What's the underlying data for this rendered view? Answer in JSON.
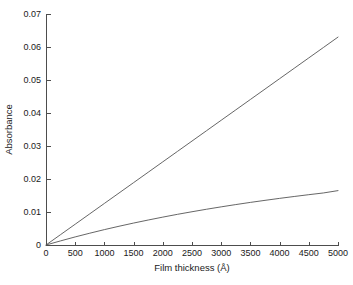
{
  "chart_data": {
    "type": "line",
    "title": "",
    "xlabel": "Film thickness (Å)",
    "ylabel": "Absorbance",
    "xlim": [
      0,
      5000
    ],
    "ylim": [
      0,
      0.07
    ],
    "xticks": [
      0,
      500,
      1000,
      1500,
      2000,
      2500,
      3000,
      3500,
      4000,
      4500,
      5000
    ],
    "xtick_labels": [
      "0",
      "500",
      "1000",
      "1500",
      "2000",
      "2500",
      "3000",
      "3500",
      "4000",
      "4500",
      "5000"
    ],
    "yticks": [
      0,
      0.01,
      0.02,
      0.03,
      0.04,
      0.05,
      0.06,
      0.07
    ],
    "ytick_labels": [
      "0",
      "0.01",
      "0.02",
      "0.03",
      "0.04",
      "0.05",
      "0.06",
      "0.07"
    ],
    "grid": false,
    "legend": null,
    "line_color": "#555555",
    "axis_color": "#4d4d4d",
    "background": "#ffffff",
    "x": [
      0,
      250,
      500,
      750,
      1000,
      1250,
      1500,
      1750,
      2000,
      2250,
      2500,
      2750,
      3000,
      3250,
      3500,
      3750,
      4000,
      4250,
      4500,
      4750,
      5000
    ],
    "series": [
      {
        "name": "linear-absorbance",
        "values": [
          0,
          0.00315,
          0.0063,
          0.00945,
          0.0126,
          0.01575,
          0.0189,
          0.02205,
          0.0252,
          0.02835,
          0.0315,
          0.03465,
          0.0378,
          0.04095,
          0.0441,
          0.04725,
          0.0504,
          0.05355,
          0.0567,
          0.05985,
          0.063
        ]
      },
      {
        "name": "saturating-absorbance",
        "values": [
          0,
          0.00125,
          0.00245,
          0.00358,
          0.00466,
          0.00568,
          0.00665,
          0.00757,
          0.00845,
          0.00929,
          0.01008,
          0.01084,
          0.01156,
          0.01225,
          0.01291,
          0.01353,
          0.01413,
          0.0147,
          0.01525,
          0.01577,
          0.01648
        ]
      }
    ]
  },
  "figure": {
    "plot_left_px": 46,
    "plot_right_px": 338,
    "plot_top_px": 14,
    "plot_bottom_px": 245
  }
}
